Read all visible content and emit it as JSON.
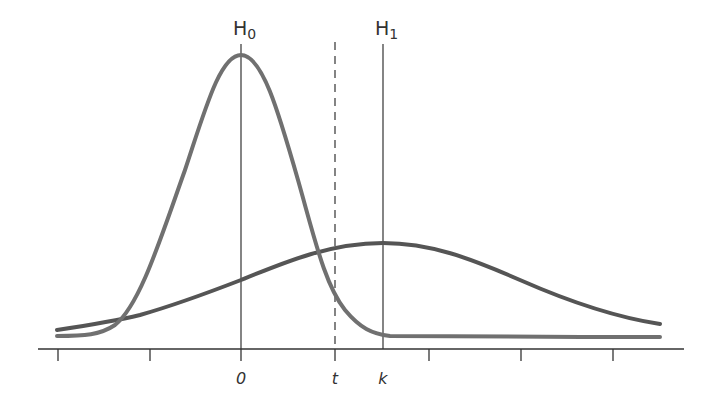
{
  "diagram": {
    "type": "hypothesis-test-distributions",
    "hypotheses": {
      "h0": {
        "label": "H",
        "subscript": "0",
        "position": "0"
      },
      "h1": {
        "label": "H",
        "subscript": "1",
        "position": "k"
      }
    },
    "axis_labels": {
      "zero": "0",
      "threshold": "t",
      "k": "k"
    },
    "curves": [
      {
        "name": "H0 distribution",
        "description": "narrow, tall peak centered at 0",
        "color": "#707070"
      },
      {
        "name": "H1 distribution",
        "description": "wide, low peak centered at k",
        "color": "#555555"
      }
    ],
    "threshold_line": {
      "label": "t",
      "style": "dashed"
    },
    "tick_count": 7,
    "colors": {
      "axis": "#333333",
      "h0_curve": "#707070",
      "h1_curve": "#555555",
      "background": "#ffffff"
    }
  }
}
